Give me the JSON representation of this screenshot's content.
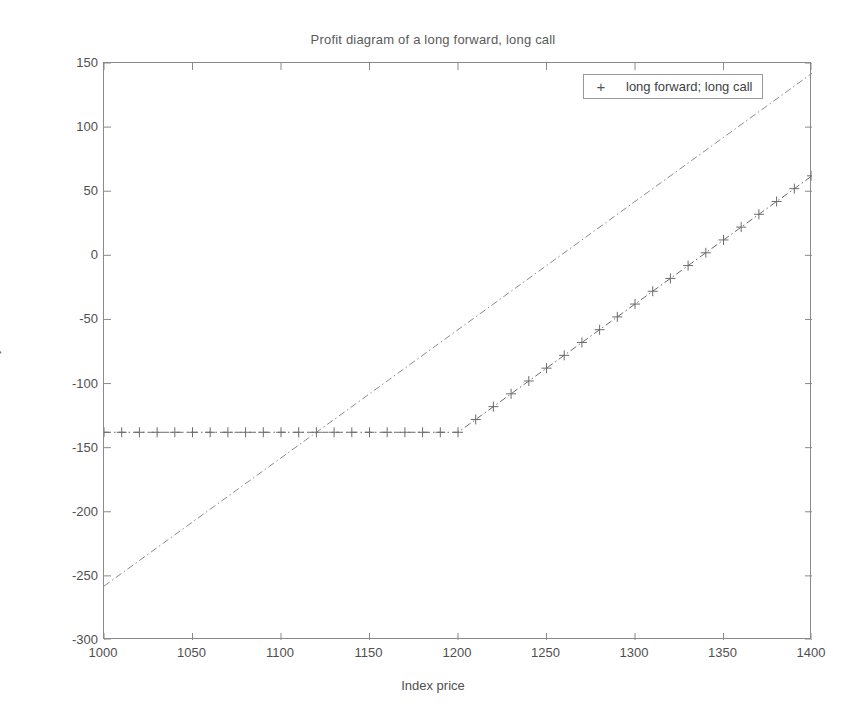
{
  "chart_data": {
    "type": "line",
    "title": "Profit diagram of a long forward, long call",
    "xlabel": "Index price",
    "ylabel": "Payoff",
    "xlim": [
      1000,
      1400
    ],
    "ylim": [
      -300,
      150
    ],
    "xticks": [
      1000,
      1050,
      1100,
      1150,
      1200,
      1250,
      1300,
      1350,
      1400
    ],
    "yticks": [
      150,
      100,
      50,
      0,
      -50,
      -100,
      -150,
      -200,
      -250,
      -300
    ],
    "grid": false,
    "legend": {
      "position": "top-right",
      "entries": [
        {
          "label": "long forward; long call",
          "marker": "+"
        }
      ]
    },
    "annotations": {
      "strike": 1200,
      "call_premium_loss": -138,
      "forward_price": 1258
    },
    "series": [
      {
        "name": "long forward",
        "marker": "none",
        "linestyle": "dashdot",
        "color": "#8c8c8c",
        "x": [
          1000,
          1400
        ],
        "y": [
          -258,
          142
        ]
      },
      {
        "name": "long call",
        "marker": "+",
        "linestyle": "dashdot",
        "color": "#6b6b6b",
        "x": [
          1000,
          1010,
          1020,
          1030,
          1040,
          1050,
          1060,
          1070,
          1080,
          1090,
          1100,
          1110,
          1120,
          1130,
          1140,
          1150,
          1160,
          1170,
          1180,
          1190,
          1200,
          1210,
          1220,
          1230,
          1240,
          1250,
          1260,
          1270,
          1280,
          1290,
          1300,
          1310,
          1320,
          1330,
          1340,
          1350,
          1360,
          1370,
          1380,
          1390,
          1400
        ],
        "y": [
          -138,
          -138,
          -138,
          -138,
          -138,
          -138,
          -138,
          -138,
          -138,
          -138,
          -138,
          -138,
          -138,
          -138,
          -138,
          -138,
          -138,
          -138,
          -138,
          -138,
          -138,
          -128,
          -118,
          -108,
          -98,
          -88,
          -78,
          -68,
          -58,
          -48,
          -38,
          -28,
          -18,
          -8,
          2,
          12,
          22,
          32,
          42,
          52,
          62
        ]
      }
    ]
  }
}
